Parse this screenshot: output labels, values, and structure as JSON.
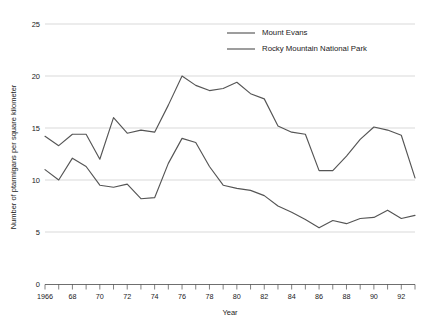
{
  "chart_data": {
    "type": "line",
    "title": "",
    "xlabel": "Year",
    "ylabel": "Number of ptarmigans per square kilometer",
    "xlim": [
      1966,
      1993
    ],
    "ylim": [
      0,
      25
    ],
    "yticks": [
      0,
      5,
      10,
      15,
      20,
      25
    ],
    "ytick_labels": [
      "0",
      "5",
      "10",
      "15",
      "20",
      "25"
    ],
    "xticks": [
      1966,
      1967,
      1968,
      1969,
      1970,
      1971,
      1972,
      1973,
      1974,
      1975,
      1976,
      1977,
      1978,
      1979,
      1980,
      1981,
      1982,
      1983,
      1984,
      1985,
      1986,
      1987,
      1988,
      1989,
      1990,
      1991,
      1992,
      1993
    ],
    "xtick_labels": [
      "1966",
      "",
      "68",
      "",
      "70",
      "",
      "72",
      "",
      "74",
      "",
      "76",
      "",
      "78",
      "",
      "80",
      "",
      "82",
      "",
      "84",
      "",
      "86",
      "",
      "88",
      "",
      "90",
      "",
      "92",
      ""
    ],
    "grid": "horizontal",
    "legend_position": "top-center",
    "x": [
      1966,
      1967,
      1968,
      1969,
      1970,
      1971,
      1972,
      1973,
      1974,
      1975,
      1976,
      1977,
      1978,
      1979,
      1980,
      1981,
      1982,
      1983,
      1984,
      1985,
      1986,
      1987,
      1988,
      1989,
      1990,
      1991,
      1992,
      1993
    ],
    "series": [
      {
        "name": "Mount Evans",
        "color": "#555555",
        "values": [
          14.2,
          13.3,
          14.4,
          14.4,
          12.0,
          16.0,
          14.5,
          14.8,
          14.6,
          17.2,
          20.0,
          19.1,
          18.6,
          18.8,
          19.4,
          18.3,
          17.8,
          15.2,
          14.6,
          14.4,
          10.9,
          10.9,
          12.3,
          13.9,
          15.1,
          14.8,
          14.3,
          10.2
        ]
      },
      {
        "name": "Rocky Mountain National Park",
        "color": "#555555",
        "values": [
          11.0,
          10.0,
          12.1,
          11.3,
          9.5,
          9.3,
          9.6,
          8.2,
          8.3,
          11.6,
          14.0,
          13.6,
          11.3,
          9.5,
          9.2,
          9.0,
          8.5,
          7.5,
          6.9,
          6.2,
          5.4,
          6.1,
          5.8,
          6.3,
          6.4,
          7.1,
          6.3,
          6.6
        ]
      }
    ],
    "legend_entries": [
      "Mount Evans",
      "Rocky Mountain National Park"
    ]
  }
}
